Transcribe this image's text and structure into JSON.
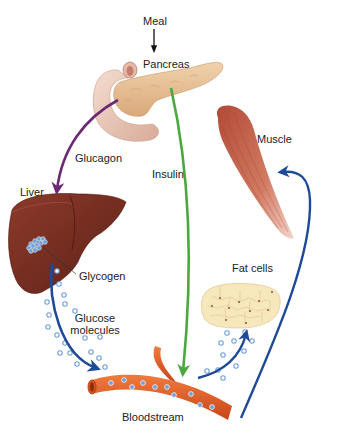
{
  "diagram": {
    "labels": {
      "meal": "Meal",
      "pancreas": "Pancreas",
      "glucagon": "Glucagon",
      "insulin": "Insulin",
      "liver": "Liver",
      "glycogen": "Glycogen",
      "glucose_line1": "Glucose",
      "glucose_line2": "molecules",
      "muscle": "Muscle",
      "fat_cells": "Fat cells",
      "bloodstream": "Bloodstream"
    },
    "arrows": [
      {
        "name": "meal-to-pancreas",
        "color": "#111111"
      },
      {
        "name": "glucagon-pancreas-to-liver",
        "color": "#6b2a72"
      },
      {
        "name": "insulin-pancreas-to-bloodstream",
        "color": "#4aa83f"
      },
      {
        "name": "glucose-liver-to-bloodstream",
        "color": "#1f4a96"
      },
      {
        "name": "glucose-bloodstream-to-fat-cells",
        "color": "#1f4a96"
      },
      {
        "name": "glucose-bloodstream-to-muscle",
        "color": "#1f4a96"
      }
    ],
    "colors": {
      "pancreas": "#e8c49c",
      "liver": "#7a2f22",
      "muscle": "#c5604a",
      "fat_cells": "#f6e7bd",
      "bloodstream": "#e05a22",
      "glucose_molecule": "#6f9fd6"
    },
    "bottom_cutoff_text": ""
  }
}
